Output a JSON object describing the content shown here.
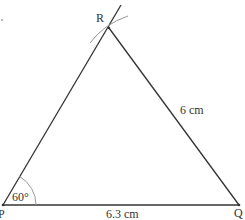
{
  "diagram": {
    "vertices": {
      "P": {
        "label": "P",
        "x": 3,
        "y": 205
      },
      "Q": {
        "label": "Q",
        "x": 239,
        "y": 205
      },
      "R": {
        "label": "R",
        "x": 109,
        "y": 28
      }
    },
    "sides": {
      "PQ": {
        "label": "6.3 cm"
      },
      "QR": {
        "label": "6 cm"
      }
    },
    "angle_P": {
      "label": "60°"
    },
    "colors": {
      "line": "#333333",
      "arc": "#999999",
      "text": "#333333"
    }
  }
}
